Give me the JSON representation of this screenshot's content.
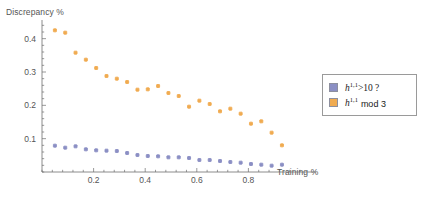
{
  "chart_data": {
    "type": "scatter",
    "title": "",
    "xlabel": "Training %",
    "ylabel": "Discrepancy %",
    "xlim": [
      0.0,
      1.0
    ],
    "ylim": [
      0.0,
      0.45
    ],
    "xticks": [
      0.2,
      0.4,
      0.6,
      0.8
    ],
    "xticklabels": [
      "0.2",
      "0.4",
      "0.6",
      "0.8"
    ],
    "yticks": [
      0.1,
      0.2,
      0.3,
      0.4
    ],
    "yticklabels": [
      "0.1",
      "0.2",
      "0.3",
      "0.4"
    ],
    "grid": false,
    "legend_position": "right",
    "minor_ticks": true,
    "series": [
      {
        "name": "h^{1,1}>10 ?",
        "color": "#8b8fc4",
        "marker": "square",
        "x": [
          0.05,
          0.09,
          0.13,
          0.17,
          0.21,
          0.25,
          0.29,
          0.33,
          0.37,
          0.41,
          0.45,
          0.49,
          0.53,
          0.57,
          0.61,
          0.65,
          0.69,
          0.73,
          0.77,
          0.81,
          0.85,
          0.89,
          0.93
        ],
        "y": [
          0.079,
          0.073,
          0.077,
          0.068,
          0.065,
          0.064,
          0.063,
          0.057,
          0.051,
          0.048,
          0.047,
          0.044,
          0.044,
          0.042,
          0.036,
          0.036,
          0.033,
          0.03,
          0.028,
          0.024,
          0.022,
          0.019,
          0.022
        ]
      },
      {
        "name": "h^{1,1} mod 3",
        "color": "#f0ab51",
        "marker": "square",
        "x": [
          0.05,
          0.09,
          0.13,
          0.17,
          0.21,
          0.25,
          0.29,
          0.33,
          0.37,
          0.41,
          0.45,
          0.49,
          0.53,
          0.57,
          0.61,
          0.65,
          0.69,
          0.73,
          0.77,
          0.81,
          0.85,
          0.89,
          0.93
        ],
        "y": [
          0.425,
          0.418,
          0.358,
          0.337,
          0.312,
          0.288,
          0.28,
          0.27,
          0.247,
          0.248,
          0.258,
          0.237,
          0.228,
          0.196,
          0.214,
          0.204,
          0.182,
          0.19,
          0.175,
          0.145,
          0.152,
          0.118,
          0.08
        ]
      }
    ],
    "legend": [
      {
        "label_html": "h<sup>1,1</sup>>10 ?",
        "label": "h^{1,1}>10 ?",
        "color": "#8b8fc4"
      },
      {
        "label_html": "h<sup>1,1</sup> mod 3",
        "label": "h^{1,1} mod 3",
        "color": "#f0ab51"
      }
    ]
  },
  "legend_box": {
    "row1": {
      "base": "h",
      "sup": "1,1",
      "rest": ">10 ?"
    },
    "row2": {
      "base": "h",
      "sup": "1,1",
      "rest": "mod 3"
    }
  },
  "colors": {
    "series_blue": "#8b8fc4",
    "series_orange": "#f0ab51",
    "axis": "#6f6f6f",
    "text": "#555555",
    "legend_border": "#9a9a9a"
  }
}
